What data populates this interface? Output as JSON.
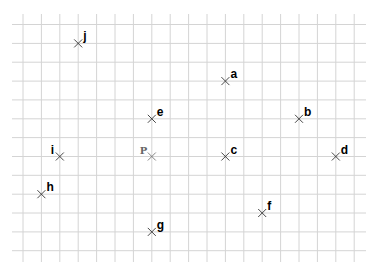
{
  "diagram": {
    "type": "grid-points",
    "grid": {
      "columns": 19,
      "rows": 13,
      "line_color": "#d4d4d4"
    },
    "points": [
      {
        "label": "j",
        "col": 3,
        "row": 1,
        "reference": false
      },
      {
        "label": "a",
        "col": 11,
        "row": 3,
        "reference": false
      },
      {
        "label": "e",
        "col": 7,
        "row": 5,
        "reference": false
      },
      {
        "label": "b",
        "col": 15,
        "row": 5,
        "reference": false
      },
      {
        "label": "i",
        "col": 2,
        "row": 7,
        "reference": false,
        "label_side": "left"
      },
      {
        "label": "P",
        "col": 7,
        "row": 7,
        "reference": true,
        "label_side": "left"
      },
      {
        "label": "c",
        "col": 11,
        "row": 7,
        "reference": false
      },
      {
        "label": "d",
        "col": 17,
        "row": 7,
        "reference": false
      },
      {
        "label": "h",
        "col": 1,
        "row": 9,
        "reference": false
      },
      {
        "label": "f",
        "col": 13,
        "row": 10,
        "reference": false
      },
      {
        "label": "g",
        "col": 7,
        "row": 11,
        "reference": false
      }
    ]
  }
}
